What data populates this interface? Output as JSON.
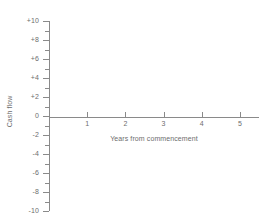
{
  "chart_data": {
    "type": "line",
    "title": "",
    "xlabel": "Years from commencement",
    "ylabel": "Cash flow",
    "xlim": [
      0,
      5.5
    ],
    "ylim": [
      -10,
      10
    ],
    "grid": false,
    "legend": null,
    "series": [],
    "x_ticks": [
      {
        "value": 1,
        "label": "1"
      },
      {
        "value": 2,
        "label": "2"
      },
      {
        "value": 3,
        "label": "3"
      },
      {
        "value": 4,
        "label": "4"
      },
      {
        "value": 5,
        "label": "5"
      }
    ],
    "y_ticks_major": [
      {
        "value": 10,
        "label": "+10"
      },
      {
        "value": 8,
        "label": "+8"
      },
      {
        "value": 6,
        "label": "+6"
      },
      {
        "value": 4,
        "label": "+4"
      },
      {
        "value": 2,
        "label": "+2"
      },
      {
        "value": 0,
        "label": "0"
      },
      {
        "value": -2,
        "label": "-2"
      },
      {
        "value": -4,
        "label": "-4"
      },
      {
        "value": -6,
        "label": "-6"
      },
      {
        "value": -8,
        "label": "-8"
      },
      {
        "value": -10,
        "label": "-10"
      }
    ],
    "y_ticks_minor": [
      9,
      7,
      5,
      3,
      1,
      -1,
      -3,
      -5,
      -7,
      -9
    ],
    "colors": {
      "axis": "#8a8a8a",
      "text": "#6d6d6d",
      "background": "#ffffff"
    }
  }
}
